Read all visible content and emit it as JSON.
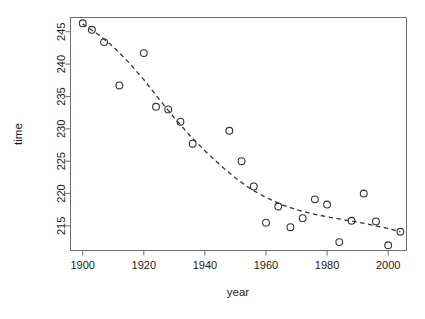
{
  "chart_data": {
    "type": "scatter",
    "title": "",
    "xlabel": "year",
    "ylabel": "time",
    "xlim": [
      1896,
      2006
    ],
    "ylim": [
      211.2,
      247.2
    ],
    "grid": false,
    "legend": null,
    "xticks": [
      1900,
      1920,
      1940,
      1960,
      1980,
      2000
    ],
    "yticks": [
      215,
      220,
      225,
      230,
      235,
      240,
      245
    ],
    "point_marker": "open-circle",
    "point_color": "#333333",
    "trend": {
      "style": "dashed",
      "color": "#333333",
      "description": "dashed fitted trend curve decreasing from about 246 in 1900 to about 214 in 2004",
      "points": [
        {
          "x": 1900,
          "y": 246.2
        },
        {
          "x": 1905,
          "y": 244.6
        },
        {
          "x": 1910,
          "y": 242.7
        },
        {
          "x": 1915,
          "y": 240.3
        },
        {
          "x": 1920,
          "y": 237.6
        },
        {
          "x": 1925,
          "y": 234.6
        },
        {
          "x": 1930,
          "y": 231.7
        },
        {
          "x": 1935,
          "y": 229.0
        },
        {
          "x": 1940,
          "y": 226.6
        },
        {
          "x": 1945,
          "y": 224.4
        },
        {
          "x": 1950,
          "y": 222.4
        },
        {
          "x": 1955,
          "y": 220.7
        },
        {
          "x": 1960,
          "y": 219.4
        },
        {
          "x": 1965,
          "y": 218.3
        },
        {
          "x": 1970,
          "y": 217.5
        },
        {
          "x": 1975,
          "y": 216.9
        },
        {
          "x": 1980,
          "y": 216.4
        },
        {
          "x": 1985,
          "y": 216.0
        },
        {
          "x": 1990,
          "y": 215.6
        },
        {
          "x": 1995,
          "y": 215.1
        },
        {
          "x": 2000,
          "y": 214.6
        },
        {
          "x": 2004,
          "y": 214.1
        }
      ]
    },
    "x": [
      1900,
      1903,
      1907,
      1912,
      1920,
      1924,
      1928,
      1932,
      1936,
      1948,
      1952,
      1956,
      1960,
      1964,
      1968,
      1972,
      1976,
      1980,
      1984,
      1988,
      1992,
      1996,
      2000,
      2004
    ],
    "y": [
      246.3,
      245.3,
      243.4,
      236.7,
      241.7,
      233.4,
      233.0,
      231.1,
      227.7,
      229.7,
      225.0,
      221.1,
      215.5,
      218.0,
      214.8,
      216.2,
      219.1,
      218.3,
      212.5,
      215.8,
      220.0,
      215.7,
      212.0,
      214.1
    ],
    "points": [
      {
        "x": 1900,
        "y": 246.3
      },
      {
        "x": 1903,
        "y": 245.3
      },
      {
        "x": 1907,
        "y": 243.4
      },
      {
        "x": 1912,
        "y": 236.7
      },
      {
        "x": 1920,
        "y": 241.7
      },
      {
        "x": 1924,
        "y": 233.4
      },
      {
        "x": 1928,
        "y": 233.0
      },
      {
        "x": 1932,
        "y": 231.1
      },
      {
        "x": 1936,
        "y": 227.7
      },
      {
        "x": 1948,
        "y": 229.7
      },
      {
        "x": 1952,
        "y": 225.0
      },
      {
        "x": 1956,
        "y": 221.1
      },
      {
        "x": 1960,
        "y": 215.5
      },
      {
        "x": 1964,
        "y": 218.0
      },
      {
        "x": 1968,
        "y": 214.8
      },
      {
        "x": 1972,
        "y": 216.2
      },
      {
        "x": 1976,
        "y": 219.1
      },
      {
        "x": 1980,
        "y": 218.3
      },
      {
        "x": 1984,
        "y": 212.5
      },
      {
        "x": 1988,
        "y": 215.8
      },
      {
        "x": 1992,
        "y": 220.0
      },
      {
        "x": 1996,
        "y": 215.7
      },
      {
        "x": 2000,
        "y": 212.0
      },
      {
        "x": 2004,
        "y": 214.1
      }
    ]
  }
}
